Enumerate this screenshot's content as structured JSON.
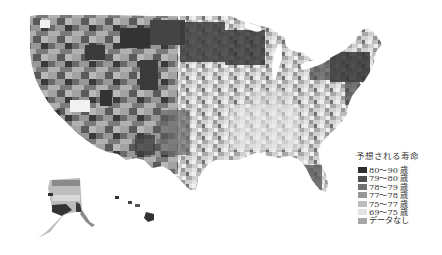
{
  "legend": {
    "title": "予想される寿命",
    "items": [
      {
        "label": "80～90 歳",
        "color": "#2e2e2e"
      },
      {
        "label": "79～80 歳",
        "color": "#4f4f4f"
      },
      {
        "label": "78～79 歳",
        "color": "#727272"
      },
      {
        "label": "77～78 歳",
        "color": "#979797"
      },
      {
        "label": "75～77 歳",
        "color": "#bdbdbd"
      },
      {
        "label": "69～75 歳",
        "color": "#e2e2e2"
      },
      {
        "label": "データなし",
        "color": "#a6a6a6"
      }
    ]
  },
  "map": {
    "subject": "United States counties life expectancy choropleth",
    "regions": [
      "contiguous-us",
      "alaska",
      "hawaii"
    ]
  }
}
